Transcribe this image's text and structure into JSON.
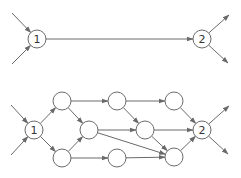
{
  "diagrams": [
    {
      "name": "single-edge-network",
      "nodes": [
        {
          "id": "n1",
          "label": "1",
          "x": 37,
          "y": 39
        },
        {
          "id": "n2",
          "label": "2",
          "x": 202,
          "y": 39
        }
      ],
      "edges": [
        {
          "from": [
            12,
            13
          ],
          "to": "n1"
        },
        {
          "from": [
            12,
            64
          ],
          "to": "n1"
        },
        {
          "from": "n1",
          "to": "n2"
        },
        {
          "from": "n2",
          "to": [
            229,
            15
          ]
        },
        {
          "from": "n2",
          "to": [
            228,
            63
          ]
        }
      ]
    },
    {
      "name": "expanded-network",
      "nodes": [
        {
          "id": "b1",
          "label": "1",
          "x": 34,
          "y": 130
        },
        {
          "id": "a_top",
          "label": "",
          "x": 62,
          "y": 101
        },
        {
          "id": "a_bot",
          "label": "",
          "x": 62,
          "y": 158
        },
        {
          "id": "b_mid",
          "label": "",
          "x": 89,
          "y": 130
        },
        {
          "id": "c_top",
          "label": "",
          "x": 117,
          "y": 101
        },
        {
          "id": "c_bot",
          "label": "",
          "x": 117,
          "y": 158
        },
        {
          "id": "d_mid",
          "label": "",
          "x": 145,
          "y": 130
        },
        {
          "id": "e_top",
          "label": "",
          "x": 174,
          "y": 101
        },
        {
          "id": "e_bot",
          "label": "",
          "x": 174,
          "y": 157
        },
        {
          "id": "b2",
          "label": "2",
          "x": 202,
          "y": 130
        }
      ],
      "edges": [
        {
          "from": [
            11,
            105
          ],
          "to": "b1"
        },
        {
          "from": [
            11,
            155
          ],
          "to": "b1"
        },
        {
          "from": "b1",
          "to": "a_top"
        },
        {
          "from": "b1",
          "to": "a_bot"
        },
        {
          "from": "a_top",
          "to": "b_mid"
        },
        {
          "from": "a_bot",
          "to": "b_mid"
        },
        {
          "from": "a_top",
          "to": "c_top"
        },
        {
          "from": "a_bot",
          "to": "c_bot"
        },
        {
          "from": "b_mid",
          "to": "d_mid"
        },
        {
          "from": "b_mid",
          "to": "e_bot"
        },
        {
          "from": "c_top",
          "to": "e_top"
        },
        {
          "from": "c_top",
          "to": "d_mid"
        },
        {
          "from": "c_bot",
          "to": "e_bot"
        },
        {
          "from": "d_mid",
          "to": "b2"
        },
        {
          "from": "d_mid",
          "to": "e_bot"
        },
        {
          "from": "e_top",
          "to": "b2"
        },
        {
          "from": "e_bot",
          "to": "b2"
        },
        {
          "from": "b2",
          "to": [
            229,
            106
          ]
        },
        {
          "from": "b2",
          "to": [
            228,
            154
          ]
        }
      ]
    }
  ],
  "style": {
    "node_radius": 9,
    "stroke": "#6a6a6a",
    "background": "#ffffff"
  }
}
